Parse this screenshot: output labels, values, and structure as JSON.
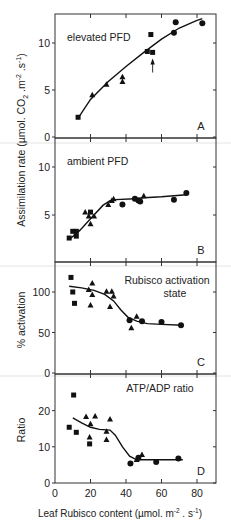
{
  "chart_data": [
    {
      "panel": "A",
      "type": "scatter",
      "annotation": "elevated PFD",
      "panel_letter": "A",
      "ylabel": "Assimilation rate (µmol. CO2 .m-2 .s-1)",
      "yticks": [
        0,
        5,
        10
      ],
      "ylim": [
        0,
        13.5
      ],
      "xlim": [
        0,
        90
      ],
      "series": [
        {
          "name": "squares",
          "marker": "square",
          "points": [
            [
              13,
              2.1
            ],
            [
              52,
              9.1
            ],
            [
              54,
              10.9
            ],
            [
              55,
              9.0
            ]
          ]
        },
        {
          "name": "triangles",
          "marker": "triangle",
          "points": [
            [
              21,
              4.5
            ],
            [
              29,
              5.6
            ],
            [
              38,
              6.4
            ],
            [
              38,
              5.9
            ]
          ]
        },
        {
          "name": "circles",
          "marker": "circle",
          "points": [
            [
              67,
              11.1
            ],
            [
              68,
              12.2
            ],
            [
              83,
              12.1
            ]
          ]
        }
      ],
      "curve": [
        [
          13,
          2.0
        ],
        [
          20,
          4.0
        ],
        [
          30,
          5.9
        ],
        [
          40,
          7.5
        ],
        [
          50,
          9.0
        ],
        [
          60,
          10.4
        ],
        [
          70,
          11.6
        ],
        [
          80,
          12.4
        ],
        [
          83,
          12.6
        ]
      ],
      "arrow": {
        "x": 55,
        "y_from": 7.5,
        "y_to": 9.0
      }
    },
    {
      "panel": "B",
      "type": "scatter",
      "annotation": "ambient PFD",
      "panel_letter": "B",
      "yticks": [
        5,
        10
      ],
      "ylim": [
        0,
        11
      ],
      "xlim": [
        0,
        90
      ],
      "series": [
        {
          "name": "squares",
          "marker": "square",
          "points": [
            [
              8,
              2.6
            ],
            [
              10,
              3.3
            ],
            [
              12,
              3.3
            ],
            [
              12,
              2.8
            ],
            [
              20,
              5.3
            ]
          ]
        },
        {
          "name": "triangles",
          "marker": "triangle",
          "points": [
            [
              17,
              5.3
            ],
            [
              19,
              4.9
            ],
            [
              20,
              4.1
            ],
            [
              22,
              4.9
            ],
            [
              30,
              6.1
            ],
            [
              32,
              6.5
            ],
            [
              33,
              6.7
            ],
            [
              48,
              6.5
            ],
            [
              50,
              7.0
            ]
          ]
        },
        {
          "name": "circles",
          "marker": "circle",
          "points": [
            [
              38,
              6.1
            ],
            [
              45,
              6.7
            ],
            [
              47,
              6.5
            ],
            [
              48,
              6.4
            ],
            [
              67,
              6.6
            ],
            [
              74,
              7.3
            ]
          ]
        }
      ],
      "curve": [
        [
          9,
          2.6
        ],
        [
          14,
          3.4
        ],
        [
          20,
          4.6
        ],
        [
          27,
          6.0
        ],
        [
          31,
          6.5
        ],
        [
          34,
          6.6
        ],
        [
          45,
          6.7
        ],
        [
          50,
          6.8
        ],
        [
          60,
          6.9
        ],
        [
          74,
          7.1
        ]
      ]
    },
    {
      "panel": "C",
      "type": "scatter",
      "annotation": "Rubisco activation state",
      "annotation_lines": [
        "Rubisco activation",
        "state"
      ],
      "panel_letter": "C",
      "ylabel": "% activation",
      "yticks": [
        0,
        50,
        100
      ],
      "ylim": [
        0,
        138
      ],
      "xlim": [
        0,
        90
      ],
      "series": [
        {
          "name": "squares",
          "marker": "square",
          "points": [
            [
              9,
              118
            ],
            [
              10,
              100
            ],
            [
              11,
              86
            ]
          ]
        },
        {
          "name": "triangles",
          "marker": "triangle",
          "points": [
            [
              21,
              111
            ],
            [
              19,
              103
            ],
            [
              21,
              97
            ],
            [
              20,
              84
            ],
            [
              29,
              101
            ],
            [
              32,
              101
            ],
            [
              33,
              95
            ],
            [
              31,
              82
            ],
            [
              46,
              70
            ],
            [
              43,
              56
            ]
          ]
        },
        {
          "name": "circles",
          "marker": "circle",
          "points": [
            [
              42,
              65
            ],
            [
              49,
              64
            ],
            [
              60,
              63
            ],
            [
              71,
              59
            ]
          ]
        }
      ],
      "curve": [
        [
          8,
          107
        ],
        [
          15,
          105
        ],
        [
          22,
          102
        ],
        [
          28,
          97
        ],
        [
          33,
          89
        ],
        [
          37,
          78
        ],
        [
          41,
          69
        ],
        [
          46,
          64
        ],
        [
          52,
          61
        ],
        [
          60,
          60
        ],
        [
          72,
          59
        ]
      ]
    },
    {
      "panel": "D",
      "type": "scatter",
      "annotation": "ATP/ADP ratio",
      "panel_letter": "D",
      "ylabel": "Ratio",
      "yticks": [
        0,
        10,
        20
      ],
      "ylim": [
        0,
        29
      ],
      "xlim": [
        0,
        90
      ],
      "xticks": [
        0,
        20,
        40,
        60,
        80
      ],
      "xlabel": "Leaf Rubisco content (µmol. m-2 . s-1)",
      "series": [
        {
          "name": "squares",
          "marker": "square",
          "points": [
            [
              10.5,
              24.3
            ],
            [
              8,
              15.4
            ],
            [
              12,
              14.0
            ],
            [
              19.5,
              10.8
            ]
          ]
        },
        {
          "name": "triangles",
          "marker": "triangle",
          "points": [
            [
              17.5,
              18.4
            ],
            [
              22.6,
              18.5
            ],
            [
              20,
              16.4
            ],
            [
              19.5,
              12.7
            ],
            [
              31,
              17.7
            ],
            [
              29,
              14.3
            ],
            [
              29,
              12.0
            ],
            [
              49,
              7.9
            ],
            [
              46,
              6.5
            ]
          ]
        },
        {
          "name": "circles",
          "marker": "circle",
          "points": [
            [
              42.5,
              5.4
            ],
            [
              47,
              7.0
            ],
            [
              57,
              5.8
            ],
            [
              69.5,
              6.8
            ]
          ]
        }
      ],
      "curve": [
        [
          10,
          18.0
        ],
        [
          15,
          16.6
        ],
        [
          20,
          15.4
        ],
        [
          25,
          14.8
        ],
        [
          31,
          14.6
        ],
        [
          34,
          13.2
        ],
        [
          38,
          10.0
        ],
        [
          42,
          7.4
        ],
        [
          46,
          6.4
        ],
        [
          55,
          6.4
        ],
        [
          72,
          6.4
        ]
      ]
    }
  ],
  "figure": {
    "shared_ylabel": "Assimilation rate (µmol. CO₂ .m⁻² .s⁻¹)",
    "ylabel_main": "Assimilation rate (µmol. CO",
    "ylabel_sub": "2",
    "ylabel_tail": " .m",
    "ylabel_sup1": "-2",
    "ylabel_mid": " .s",
    "ylabel_sup2": "-1",
    "ylabel_close": ")",
    "xlabel_main": "Leaf Rubisco content (µmol. m",
    "xlabel_sup1": "-2",
    "xlabel_mid": " . s",
    "xlabel_sup2": "-1",
    "xlabel_close": ")",
    "panel_c_ylabel": "% activation",
    "panel_d_ylabel": "Ratio"
  }
}
